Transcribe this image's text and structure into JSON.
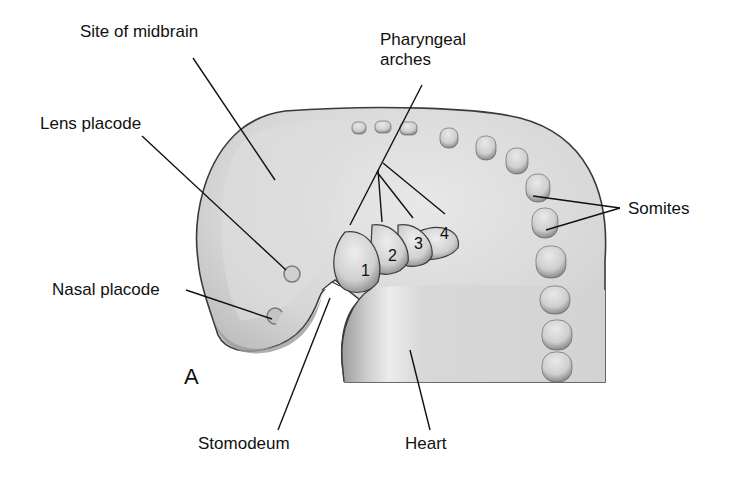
{
  "figure": {
    "panel_letter": "A",
    "colors": {
      "body_fill": "#d4d4d4",
      "body_light": "#e6e6e6",
      "shadow": "#9a9a9a",
      "outline": "#3a3a3a",
      "leader_line": "#111111",
      "background": "#ffffff"
    }
  },
  "labels": {
    "midbrain": "Site of midbrain",
    "pharyngeal_line1": "Pharyngeal",
    "pharyngeal_line2": "arches",
    "lens": "Lens placode",
    "nasal": "Nasal placode",
    "somites": "Somites",
    "stomodeum": "Stomodeum",
    "heart": "Heart"
  },
  "arches": [
    "1",
    "2",
    "3",
    "4"
  ]
}
